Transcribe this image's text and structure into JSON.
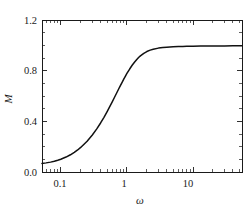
{
  "chart_data": {
    "type": "line",
    "title": "",
    "subtitle": "",
    "xlabel": "ω",
    "ylabel": "M",
    "xscale": "log",
    "yscale": "linear",
    "xlim": [
      0.052,
      55
    ],
    "ylim": [
      0.0,
      1.2
    ],
    "grid": false,
    "legend": null,
    "xticks": [
      0.1,
      1,
      10
    ],
    "xtick_labels": [
      "0.1",
      "1",
      "10"
    ],
    "yticks": [
      0.0,
      0.4,
      0.8,
      1.2
    ],
    "ytick_labels": [
      "0.0",
      "0.4",
      "0.8",
      "1.2"
    ],
    "series": [
      {
        "name": "M",
        "color": "#111111",
        "x": [
          0.052,
          0.06,
          0.07,
          0.08,
          0.09,
          0.1,
          0.12,
          0.14,
          0.16,
          0.18,
          0.2,
          0.25,
          0.3,
          0.35,
          0.4,
          0.45,
          0.5,
          0.55,
          0.6,
          0.65,
          0.7,
          0.75,
          0.8,
          0.85,
          0.9,
          0.95,
          1.0,
          1.1,
          1.2,
          1.3,
          1.4,
          1.5,
          1.6,
          1.8,
          2.0,
          2.25,
          2.5,
          3.0,
          3.5,
          4.0,
          5.0,
          6.0,
          7.0,
          8.0,
          10.0,
          13.0,
          16.0,
          20.0,
          25.0,
          30.0,
          40.0,
          55.0
        ],
        "y": [
          0.068,
          0.072,
          0.078,
          0.085,
          0.093,
          0.101,
          0.118,
          0.136,
          0.155,
          0.174,
          0.194,
          0.243,
          0.292,
          0.34,
          0.387,
          0.432,
          0.475,
          0.516,
          0.554,
          0.59,
          0.624,
          0.655,
          0.684,
          0.71,
          0.735,
          0.757,
          0.778,
          0.813,
          0.843,
          0.867,
          0.887,
          0.904,
          0.917,
          0.937,
          0.951,
          0.962,
          0.969,
          0.978,
          0.982,
          0.985,
          0.988,
          0.99,
          0.991,
          0.992,
          0.993,
          0.994,
          0.994,
          0.995,
          0.995,
          0.995,
          0.996,
          0.996
        ]
      }
    ]
  },
  "axes": {
    "y_labels": [
      "1.2",
      "0.8",
      "0.4",
      "0.0"
    ],
    "x_labels": [
      "0.1",
      "1",
      "10"
    ],
    "x_title": "ω",
    "y_title": "M"
  }
}
